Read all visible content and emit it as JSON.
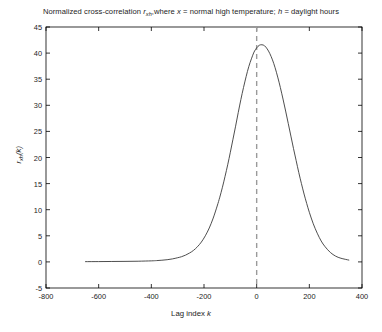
{
  "chart_data": {
    "type": "line",
    "title_parts": {
      "lead": "Normalized cross-correlation ",
      "symbol": "r",
      "symbol_sub": "xh",
      "trail": ",where ",
      "var_x": "x",
      "desc_x": " = normal high temperature; ",
      "var_h": "h",
      "desc_h": " = daylight hours"
    },
    "xlabel": "Lag index k",
    "xlabel_parts": {
      "text": "Lag index ",
      "var": "k"
    },
    "ylabel": "r_xh(k)",
    "ylabel_parts": {
      "symbol": "r",
      "symbol_sub": "xh",
      "arg": "(k)"
    },
    "xlim": [
      -800,
      400
    ],
    "ylim": [
      -5,
      45
    ],
    "xticks": [
      -800,
      -600,
      -400,
      -200,
      0,
      200,
      400
    ],
    "xtick_labels": [
      "-800",
      "-600",
      "-400",
      "-200",
      "0",
      "200",
      "400"
    ],
    "yticks": [
      -5,
      0,
      5,
      10,
      15,
      20,
      25,
      30,
      35,
      40,
      45
    ],
    "ytick_labels": [
      "-5",
      "0",
      "5",
      "10",
      "15",
      "20",
      "25",
      "30",
      "35",
      "40",
      "45"
    ],
    "grid": false,
    "legend": null,
    "line_color": "#3a3a3a",
    "axis_color": "#000000",
    "reference_line": {
      "name": "zero-lag",
      "x": 0,
      "style": "dashed",
      "color": "#9a9a9a"
    },
    "series": [
      {
        "name": "r_xh(k)",
        "peak_x": 20,
        "peak_y": 41.6,
        "x_start": -650,
        "x_end": 350,
        "x": [
          -650,
          -600,
          -550,
          -500,
          -450,
          -400,
          -380,
          -360,
          -340,
          -320,
          -300,
          -285,
          -270,
          -255,
          -240,
          -225,
          -210,
          -195,
          -180,
          -165,
          -150,
          -140,
          -130,
          -120,
          -110,
          -100,
          -90,
          -80,
          -70,
          -60,
          -50,
          -40,
          -30,
          -20,
          -10,
          0,
          10,
          20,
          30,
          40,
          50,
          60,
          70,
          80,
          90,
          100,
          110,
          120,
          130,
          140,
          150,
          160,
          170,
          180,
          190,
          200,
          215,
          230,
          245,
          260,
          280,
          300,
          320,
          350
        ],
        "values": [
          0.05,
          0.06,
          0.08,
          0.1,
          0.13,
          0.2,
          0.25,
          0.32,
          0.42,
          0.57,
          0.8,
          1.0,
          1.3,
          1.7,
          2.2,
          2.9,
          3.8,
          5.0,
          6.5,
          8.4,
          10.7,
          12.4,
          14.3,
          16.4,
          18.6,
          21.0,
          23.5,
          26.0,
          28.6,
          31.1,
          33.4,
          35.5,
          37.4,
          38.9,
          40.2,
          41.0,
          41.5,
          41.6,
          41.4,
          40.8,
          39.9,
          38.7,
          37.2,
          35.4,
          33.4,
          31.2,
          28.9,
          26.5,
          24.1,
          21.7,
          19.4,
          17.1,
          15.0,
          13.0,
          11.2,
          9.5,
          7.3,
          5.5,
          4.0,
          2.9,
          1.8,
          1.1,
          0.7,
          0.35
        ]
      }
    ]
  }
}
